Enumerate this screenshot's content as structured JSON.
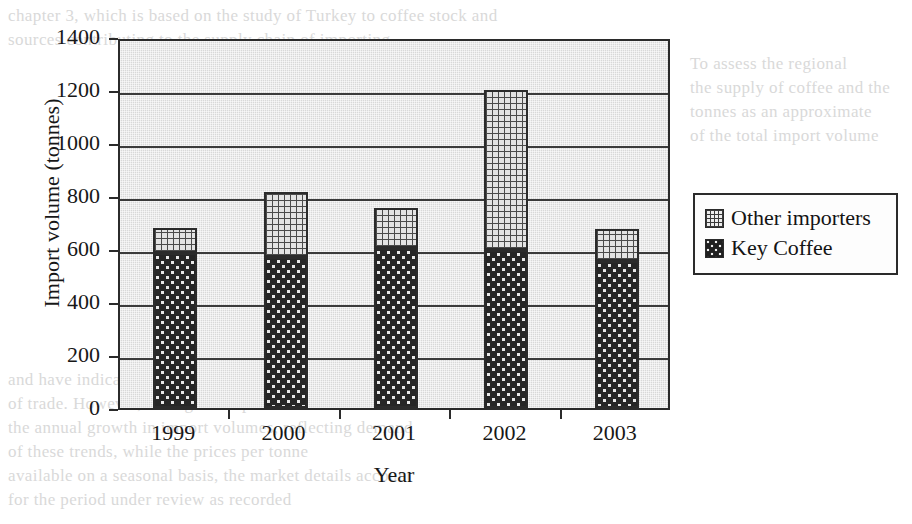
{
  "chart_data": {
    "type": "bar",
    "stacked": true,
    "title": "",
    "xlabel": "Year",
    "ylabel": "Import volume (tonnes)",
    "categories": [
      "1999",
      "2000",
      "2001",
      "2002",
      "2003"
    ],
    "series": [
      {
        "name": "Key Coffee",
        "values": [
          585,
          570,
          605,
          595,
          555
        ]
      },
      {
        "name": "Other importers",
        "values": [
          95,
          245,
          150,
          605,
          120
        ]
      }
    ],
    "totals": [
      680,
      815,
      755,
      1200,
      675
    ],
    "ylim": [
      0,
      1400
    ],
    "ytick_labels": [
      "1400",
      "1200",
      "1000",
      "800",
      "600",
      "400",
      "200",
      "0"
    ],
    "ytick_values": [
      1400,
      1200,
      1000,
      800,
      600,
      400,
      200,
      0
    ],
    "grid": true,
    "legend_position": "right",
    "colors": {
      "plot_background": "#d8d8d8",
      "axis": "#2b2b2b",
      "key_coffee": "#262626",
      "other_importers": "#e3e3e3",
      "text": "#171717"
    }
  },
  "legend": {
    "entries": [
      {
        "label": "Other importers",
        "swatch": "grid-swatch"
      },
      {
        "label": "Key Coffee",
        "swatch": "dotted-swatch"
      }
    ]
  },
  "page_scan": {
    "ghost_text": {
      "top_1": "chapter 3, which is based on the study of Turkey to coffee stock and",
      "top_2": "sources contributing to the supply chain of importing",
      "right_1": "To assess the regional",
      "right_2": "the supply of coffee and the",
      "right_3": "tonnes as an approximate",
      "right_4": "of the total import volume",
      "bottom_1": "and have indicated that the",
      "bottom_2": "of trade. However, the figures reported in these tables",
      "bottom_3": "the annual growth in import volumes, reflecting demand",
      "bottom_4": "of these trends, while the prices per tonne",
      "bottom_5": "available on a seasonal basis, the market details account",
      "bottom_6": "for the period under review as recorded"
    }
  }
}
